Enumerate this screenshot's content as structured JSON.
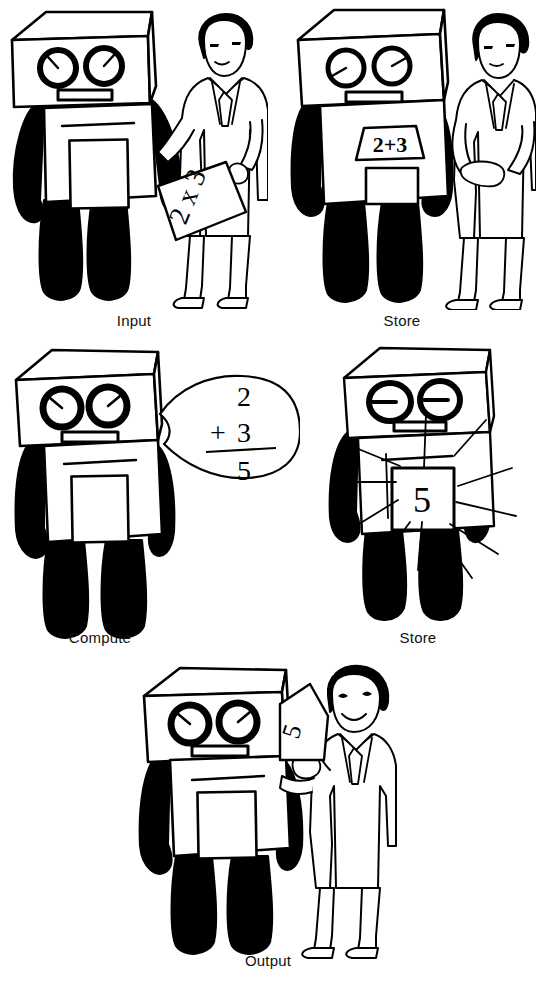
{
  "figure": {
    "style": "black-and-white line drawing",
    "background_color": "#ffffff",
    "ink_color": "#000000",
    "panel_count": 5
  },
  "panels": [
    {
      "id": "input",
      "caption": "Input",
      "robot": {
        "eyes": "dial-eyes-diagonal",
        "mouth": "rectangular-slot",
        "chest_display": "blank",
        "chest_display_text": "",
        "arms": "left-arm-down-right-arm-extended"
      },
      "person": {
        "present": true,
        "expression": "neutral",
        "holding": "paper",
        "paper_text": "2 x 3",
        "side": "right"
      },
      "effects": []
    },
    {
      "id": "store-1",
      "caption": "Store",
      "robot": {
        "eyes": "dial-eyes-diagonal",
        "mouth": "rectangular-slot",
        "chest_display": "banner",
        "chest_display_text": "2+3",
        "arms": "both-arms-down"
      },
      "person": {
        "present": true,
        "expression": "neutral",
        "holding": "none",
        "paper_text": "",
        "side": "right"
      },
      "effects": []
    },
    {
      "id": "compute",
      "caption": "Compute",
      "robot": {
        "eyes": "dial-eyes-bold-diagonal",
        "mouth": "rectangular-slot",
        "chest_display": "blank",
        "chest_display_text": "",
        "arms": "both-arms-down"
      },
      "person": {
        "present": false,
        "expression": "",
        "holding": "",
        "paper_text": "",
        "side": ""
      },
      "effects": [
        "thought-bubble"
      ],
      "thought_bubble": {
        "operand_1": "2",
        "operator": "+",
        "operand_2": "3",
        "rule": true,
        "result": "5"
      }
    },
    {
      "id": "store-2",
      "caption": "Store",
      "robot": {
        "eyes": "dash-eyes-flat",
        "mouth": "rectangular-slot",
        "chest_display": "result",
        "chest_display_text": "5",
        "arms": "both-arms-down"
      },
      "person": {
        "present": false,
        "expression": "",
        "holding": "",
        "paper_text": "",
        "side": ""
      },
      "effects": [
        "radiating-sparkle-lines"
      ]
    },
    {
      "id": "output",
      "caption": "Output",
      "robot": {
        "eyes": "dial-eyes-bold-diagonal",
        "mouth": "rectangular-slot",
        "chest_display": "blank",
        "chest_display_text": "",
        "arms": "right-arm-extended"
      },
      "person": {
        "present": true,
        "expression": "smiling",
        "holding": "paper",
        "paper_text": "5",
        "side": "right"
      },
      "effects": []
    }
  ]
}
